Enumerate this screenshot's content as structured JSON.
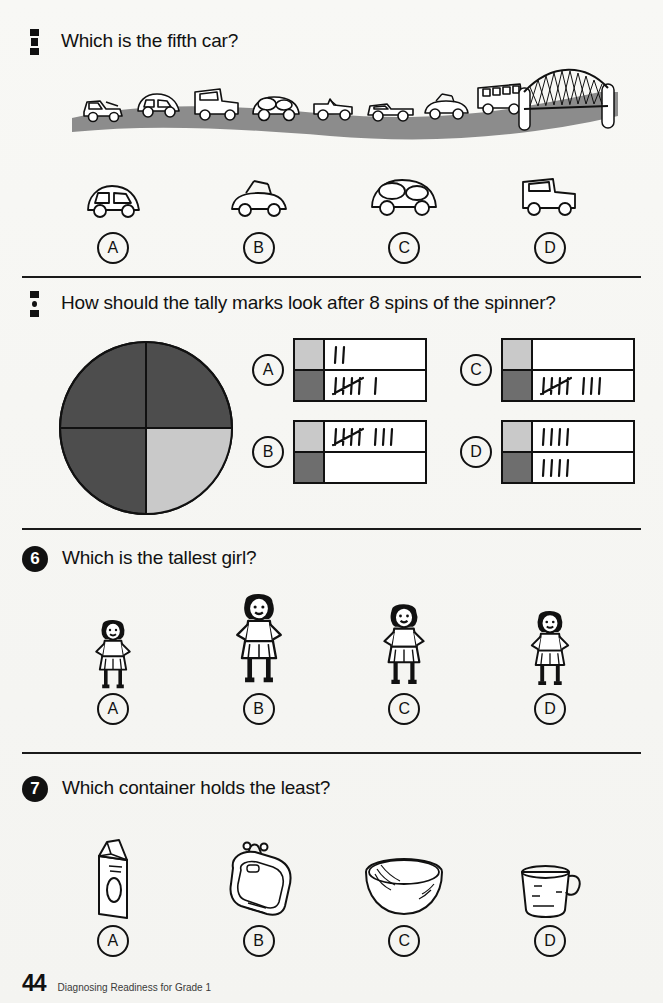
{
  "page": {
    "number": "44",
    "footer_text": "Diagnosing Readiness for Grade 1",
    "background_color": "#f6f6f3",
    "ink_color": "#111111"
  },
  "colors": {
    "road_gray": "#8c8c8c",
    "swatch_light": "#c9c9c9",
    "swatch_dark": "#6e6e6e",
    "spinner_dark": "#4d4d4d",
    "spinner_light": "#c9c9c9"
  },
  "questions": [
    {
      "number": "4",
      "number_style": "clipped-bar",
      "prompt": "Which is the fifth car?",
      "scene": {
        "name": "cars-on-road-with-bridge",
        "vehicle_count": 8,
        "vehicles": [
          "tow-truck",
          "car",
          "truck",
          "beetle",
          "jeep",
          "pickup",
          "convertible",
          "bus"
        ],
        "landmark": "bridge"
      },
      "choices": [
        {
          "letter": "A",
          "icon": "small-car"
        },
        {
          "letter": "B",
          "icon": "convertible"
        },
        {
          "letter": "C",
          "icon": "beetle"
        },
        {
          "letter": "D",
          "icon": "jeep"
        }
      ]
    },
    {
      "number": "5",
      "number_style": "clipped-dots",
      "prompt": "How should the tally marks look after 8 spins of the spinner?",
      "spinner": {
        "name": "four-quadrant-spinner",
        "quadrants": [
          "dark",
          "dark",
          "dark",
          "light"
        ],
        "dark_count": 3,
        "light_count": 1
      },
      "choices": [
        {
          "letter": "A",
          "rows": [
            {
              "swatch": "light",
              "tallies": 2
            },
            {
              "swatch": "dark",
              "tallies": 6
            }
          ]
        },
        {
          "letter": "C",
          "rows": [
            {
              "swatch": "light",
              "tallies": 0
            },
            {
              "swatch": "dark",
              "tallies": 8
            }
          ]
        },
        {
          "letter": "B",
          "rows": [
            {
              "swatch": "light",
              "tallies": 8
            },
            {
              "swatch": "dark",
              "tallies": 0
            }
          ]
        },
        {
          "letter": "D",
          "rows": [
            {
              "swatch": "light",
              "tallies": 4
            },
            {
              "swatch": "dark",
              "tallies": 4
            }
          ]
        }
      ]
    },
    {
      "number": "6",
      "number_style": "circle",
      "prompt": "Which is the tallest girl?",
      "choices": [
        {
          "letter": "A",
          "icon": "girl",
          "height_px": 72
        },
        {
          "letter": "B",
          "icon": "girl",
          "height_px": 104
        },
        {
          "letter": "C",
          "icon": "girl",
          "height_px": 92
        },
        {
          "letter": "D",
          "icon": "girl",
          "height_px": 84
        }
      ]
    },
    {
      "number": "7",
      "number_style": "circle",
      "prompt": "Which container holds the least?",
      "choices": [
        {
          "letter": "A",
          "icon": "milk-carton"
        },
        {
          "letter": "B",
          "icon": "bathtub"
        },
        {
          "letter": "C",
          "icon": "bowl"
        },
        {
          "letter": "D",
          "icon": "measuring-cup"
        }
      ]
    }
  ]
}
